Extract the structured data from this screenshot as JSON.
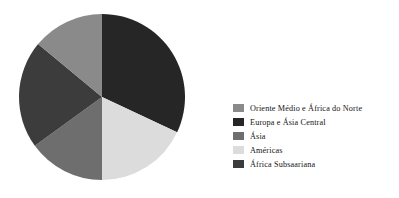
{
  "chart_data": {
    "type": "pie",
    "title": "",
    "subtitle": "",
    "xlabel": "",
    "ylabel": "",
    "grid": false,
    "legend_position": "right",
    "start_angle_deg": 0,
    "direction": "clockwise",
    "categories": [
      "Oriente Médio e África do Norte",
      "Europa e Ásia Central",
      "Ásia",
      "Américas",
      "África Subsaariana"
    ],
    "values": [
      14,
      32,
      15,
      18,
      21
    ],
    "slice_angles_deg": [
      50,
      115,
      55,
      65,
      75
    ],
    "colors": [
      "#8a8a8a",
      "#262626",
      "#6e6e6e",
      "#dcdcdc",
      "#3c3c3c"
    ],
    "slices": [
      {
        "label": "Oriente Médio e África do Norte",
        "value": 14,
        "angle_deg": 50,
        "color": "#8a8a8a",
        "order_clockwise_from_top": 5
      },
      {
        "label": "Europa e Ásia Central",
        "value": 32,
        "angle_deg": 115,
        "color": "#262626",
        "order_clockwise_from_top": 1
      },
      {
        "label": "Ásia",
        "value": 15,
        "angle_deg": 55,
        "color": "#6e6e6e",
        "order_clockwise_from_top": 3
      },
      {
        "label": "Américas",
        "value": 18,
        "angle_deg": 65,
        "color": "#dcdcdc",
        "order_clockwise_from_top": 2
      },
      {
        "label": "África Subsaariana",
        "value": 21,
        "angle_deg": 75,
        "color": "#3c3c3c",
        "order_clockwise_from_top": 4
      }
    ]
  },
  "legend": {
    "items": [
      {
        "label": "Oriente Médio e África do Norte",
        "color": "#8a8a8a"
      },
      {
        "label": "Europa e Ásia Central",
        "color": "#262626"
      },
      {
        "label": "Ásia",
        "color": "#6e6e6e"
      },
      {
        "label": "Américas",
        "color": "#dcdcdc"
      },
      {
        "label": "África Subsaariana",
        "color": "#3c3c3c"
      }
    ]
  }
}
